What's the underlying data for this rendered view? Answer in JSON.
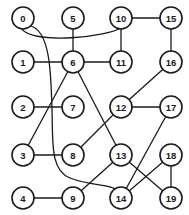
{
  "graph": {
    "node_radius": 11,
    "colors": {
      "stroke": "#1a1a1a",
      "fill": "#ffffff",
      "background": "#ffffff"
    },
    "nodes": [
      {
        "id": "0",
        "x": 23,
        "y": 18
      },
      {
        "id": "5",
        "x": 73,
        "y": 18
      },
      {
        "id": "10",
        "x": 121,
        "y": 18
      },
      {
        "id": "15",
        "x": 171,
        "y": 18
      },
      {
        "id": "1",
        "x": 23,
        "y": 62
      },
      {
        "id": "6",
        "x": 73,
        "y": 62
      },
      {
        "id": "11",
        "x": 121,
        "y": 62
      },
      {
        "id": "16",
        "x": 171,
        "y": 62
      },
      {
        "id": "2",
        "x": 23,
        "y": 107
      },
      {
        "id": "7",
        "x": 73,
        "y": 107
      },
      {
        "id": "12",
        "x": 121,
        "y": 107
      },
      {
        "id": "17",
        "x": 171,
        "y": 107
      },
      {
        "id": "3",
        "x": 23,
        "y": 155
      },
      {
        "id": "8",
        "x": 73,
        "y": 155
      },
      {
        "id": "13",
        "x": 121,
        "y": 155
      },
      {
        "id": "18",
        "x": 171,
        "y": 155
      },
      {
        "id": "4",
        "x": 23,
        "y": 198
      },
      {
        "id": "9",
        "x": 73,
        "y": 198
      },
      {
        "id": "14",
        "x": 121,
        "y": 198
      },
      {
        "id": "19",
        "x": 171,
        "y": 198
      }
    ],
    "edges": [
      {
        "from": "0",
        "to": "10",
        "curve": true
      },
      {
        "from": "0",
        "to": "14",
        "curve": true
      },
      {
        "from": "5",
        "to": "6"
      },
      {
        "from": "10",
        "to": "11"
      },
      {
        "from": "10",
        "to": "15"
      },
      {
        "from": "15",
        "to": "16"
      },
      {
        "from": "1",
        "to": "6"
      },
      {
        "from": "6",
        "to": "11"
      },
      {
        "from": "6",
        "to": "3"
      },
      {
        "from": "6",
        "to": "13"
      },
      {
        "from": "2",
        "to": "7"
      },
      {
        "from": "16",
        "to": "12"
      },
      {
        "from": "12",
        "to": "17"
      },
      {
        "from": "12",
        "to": "8"
      },
      {
        "from": "3",
        "to": "8"
      },
      {
        "from": "13",
        "to": "9"
      },
      {
        "from": "13",
        "to": "19"
      },
      {
        "from": "4",
        "to": "9"
      },
      {
        "from": "17",
        "to": "14"
      },
      {
        "from": "18",
        "to": "14"
      },
      {
        "from": "18",
        "to": "19"
      }
    ]
  }
}
